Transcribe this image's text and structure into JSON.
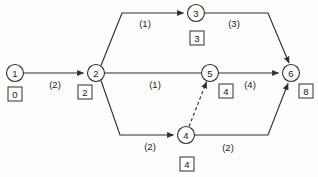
{
  "diagram": {
    "type": "activity-network-diagram",
    "title": "",
    "background_color": "#fdfdfc",
    "line_color": "#2f2f2f",
    "text_color": "#1a1a1a",
    "nodes": [
      {
        "id": "1",
        "label": "1",
        "cx": 15,
        "cy": 73,
        "r": 8.5,
        "box": {
          "label": "0",
          "x": 8,
          "y": 87
        }
      },
      {
        "id": "2",
        "label": "2",
        "cx": 96,
        "cy": 73,
        "r": 8.5,
        "box": {
          "label": "2",
          "x": 78,
          "y": 85
        }
      },
      {
        "id": "3",
        "label": "3",
        "cx": 196,
        "cy": 13,
        "r": 8.5,
        "box": {
          "label": "3",
          "x": 190,
          "y": 31
        }
      },
      {
        "id": "4",
        "label": "4",
        "cx": 186,
        "cy": 135,
        "r": 8.5,
        "box": {
          "label": "4",
          "x": 180,
          "y": 157
        }
      },
      {
        "id": "5",
        "label": "5",
        "cx": 210,
        "cy": 73,
        "r": 8.5,
        "box": {
          "label": "4",
          "x": 219,
          "y": 84
        }
      },
      {
        "id": "6",
        "label": "6",
        "cx": 291,
        "cy": 73,
        "r": 8.5,
        "box": {
          "label": "8",
          "x": 299,
          "y": 84
        }
      }
    ],
    "edges": [
      {
        "id": "e1-2",
        "from": "1",
        "to": "2",
        "weight": "(2)",
        "style": "solid",
        "arrow": true,
        "label_x": 55,
        "label_y": 84
      },
      {
        "id": "e2-3",
        "from": "2",
        "to": "3",
        "weight": "(1)",
        "style": "solid",
        "arrow": true,
        "label_x": 145,
        "label_y": 23
      },
      {
        "id": "e2-5",
        "from": "2",
        "to": "5",
        "weight": "(1)",
        "style": "solid",
        "arrow": false,
        "label_x": 155,
        "label_y": 84
      },
      {
        "id": "e2-4",
        "from": "2",
        "to": "4",
        "weight": "(2)",
        "style": "solid",
        "arrow": true,
        "label_x": 150,
        "label_y": 146
      },
      {
        "id": "e3-6",
        "from": "3",
        "to": "6",
        "weight": "(3)",
        "style": "solid",
        "arrow": true,
        "label_x": 234,
        "label_y": 23
      },
      {
        "id": "e5-6",
        "from": "5",
        "to": "6",
        "weight": "(4)",
        "style": "solid",
        "arrow": true,
        "label_x": 250,
        "label_y": 84
      },
      {
        "id": "e4-6",
        "from": "4",
        "to": "6",
        "weight": "(2)",
        "style": "solid",
        "arrow": true,
        "label_x": 228,
        "label_y": 147
      },
      {
        "id": "e4-5",
        "from": "4",
        "to": "5",
        "weight": "",
        "style": "dashed",
        "arrow": true,
        "label_x": 0,
        "label_y": 0
      }
    ]
  }
}
